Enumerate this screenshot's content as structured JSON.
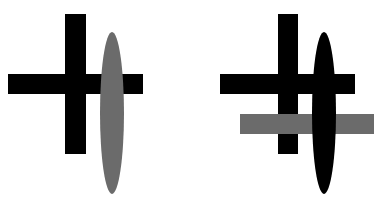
{
  "figure": {
    "colors": {
      "background": "#ffffff",
      "black": "#000000",
      "gray": "#6b6b6b"
    },
    "left_figure": {
      "cross_vertical": {
        "x": 65,
        "y": 14,
        "w": 21,
        "h": 140,
        "color": "#000000"
      },
      "cross_horizontal": {
        "x": 8,
        "y": 74,
        "w": 135,
        "h": 20,
        "color": "#000000"
      },
      "ellipse": {
        "cx": 112,
        "cy": 113,
        "rx": 12,
        "ry": 81,
        "color": "#6b6b6b"
      }
    },
    "right_figure": {
      "cross_vertical": {
        "x": 278,
        "y": 14,
        "w": 20,
        "h": 140,
        "color": "#000000"
      },
      "cross_horizontal": {
        "x": 220,
        "y": 74,
        "w": 135,
        "h": 20,
        "color": "#000000"
      },
      "gray_bar": {
        "x": 240,
        "y": 114,
        "w": 134,
        "h": 20,
        "color": "#6b6b6b"
      },
      "ellipse": {
        "cx": 324,
        "cy": 113,
        "rx": 12,
        "ry": 81,
        "color": "#000000"
      }
    }
  }
}
